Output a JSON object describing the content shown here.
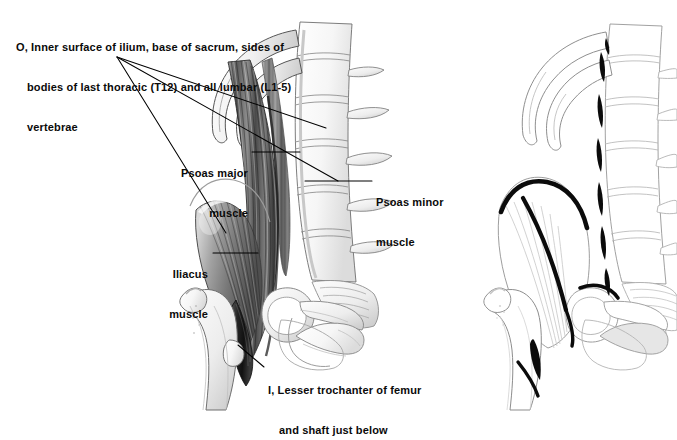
{
  "plate": {
    "title": "Iliopsoas (psoas major, psoas minor, iliacus) — origin and insertion",
    "background_color": "#ffffff",
    "ink_color": "#111111",
    "leader_color": "#000000",
    "figure_count": 2,
    "figures": [
      {
        "name": "muscle-view",
        "description": "Anterior view of lumbar spine, lower ribs, pelvis and proximal femur with psoas major, psoas minor and iliacus muscles shaded in"
      },
      {
        "name": "bone-view",
        "description": "Same skeletal view with muscles removed; origins and insertion marked in bold black"
      }
    ]
  },
  "labels": {
    "origin": {
      "name": "origin-label",
      "marker": "O,",
      "line1": "O, Inner surface of ilium, base of sacrum, sides of",
      "line2": "bodies of last thoracic (T12) and all lumbar (L1-5)",
      "line3": "vertebrae",
      "full_text": "O, Inner surface of ilium, base of sacrum, sides of bodies of last thoracic (T12) and all lumbar (L1-5) vertebrae",
      "leader_count": 3
    },
    "insertion": {
      "name": "insertion-label",
      "marker": "I,",
      "line1": "I, Lesser trochanter of femur",
      "line2": "and shaft just below",
      "full_text": "I, Lesser trochanter of femur and shaft just below",
      "leader_count": 1
    },
    "psoas_major": {
      "name": "psoas-major-label",
      "line1": "Psoas major",
      "line2": "muscle",
      "full_text": "Psoas major muscle"
    },
    "psoas_minor": {
      "name": "psoas-minor-label",
      "line1": "Psoas minor",
      "line2": "muscle",
      "full_text": "Psoas minor muscle"
    },
    "iliacus": {
      "name": "iliacus-label",
      "line1": "Iliacus",
      "line2": "muscle",
      "full_text": "Iliacus muscle"
    }
  },
  "anatomy": {
    "structures": [
      "rib T11",
      "rib T12",
      "lumbar vertebrae L1-L5",
      "transverse processes",
      "sacrum",
      "ilium",
      "iliac crest",
      "iliac fossa",
      "acetabulum",
      "obturator foramen",
      "pubis",
      "ischium",
      "femur",
      "greater trochanter",
      "lesser trochanter",
      "psoas major muscle",
      "psoas minor muscle",
      "iliacus muscle"
    ],
    "vertebra_levels": [
      "T12",
      "L1",
      "L2",
      "L3",
      "L4",
      "L5"
    ]
  }
}
